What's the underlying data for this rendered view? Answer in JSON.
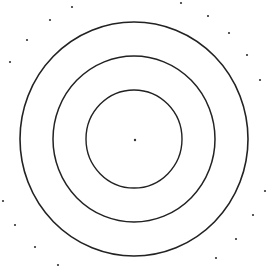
{
  "figure": {
    "width": 268,
    "height": 267,
    "background": "#ffffff",
    "stroke_color": "#222222",
    "dot_color": "#333333",
    "center": {
      "x": 134,
      "y": 139
    },
    "rings": [
      {
        "name": "outer-ring",
        "rx": 114,
        "ry": 117,
        "stroke_width": 1.6
      },
      {
        "name": "middle-ring",
        "rx": 81,
        "ry": 83,
        "stroke_width": 1.5
      },
      {
        "name": "inner-ring",
        "rx": 48,
        "ry": 49,
        "stroke_width": 1.4
      }
    ],
    "center_dot": {
      "x": 135,
      "y": 140,
      "r": 1.2
    },
    "scatter_dots": [
      {
        "x": 72,
        "y": 7
      },
      {
        "x": 50,
        "y": 20
      },
      {
        "x": 27,
        "y": 40
      },
      {
        "x": 10,
        "y": 62
      },
      {
        "x": 181,
        "y": 3
      },
      {
        "x": 208,
        "y": 16
      },
      {
        "x": 229,
        "y": 33
      },
      {
        "x": 247,
        "y": 55
      },
      {
        "x": 260,
        "y": 80
      },
      {
        "x": 3,
        "y": 201
      },
      {
        "x": 15,
        "y": 225
      },
      {
        "x": 35,
        "y": 247
      },
      {
        "x": 58,
        "y": 265
      },
      {
        "x": 265,
        "y": 191
      },
      {
        "x": 253,
        "y": 215
      },
      {
        "x": 236,
        "y": 239
      },
      {
        "x": 216,
        "y": 258
      }
    ],
    "scatter_dot_radius": 1.1
  }
}
